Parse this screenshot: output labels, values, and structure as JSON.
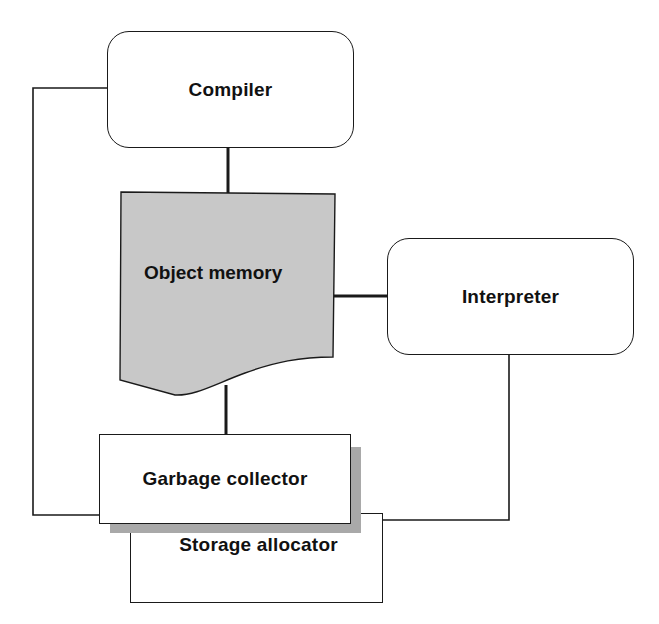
{
  "diagram": {
    "nodes": {
      "compiler": {
        "label": "Compiler",
        "shape": "rounded-rectangle"
      },
      "object_memory": {
        "label": "Object memory",
        "shape": "document",
        "fill": "#c8c8c8"
      },
      "interpreter": {
        "label": "Interpreter",
        "shape": "rounded-rectangle"
      },
      "garbage_collector": {
        "label": "Garbage collector",
        "shape": "rectangle-with-shadow"
      },
      "storage_allocator": {
        "label": "Storage allocator",
        "shape": "rectangle"
      }
    },
    "edges": [
      {
        "from": "compiler",
        "to": "object_memory",
        "style": "thick"
      },
      {
        "from": "object_memory",
        "to": "interpreter",
        "style": "thick"
      },
      {
        "from": "object_memory",
        "to": "garbage_collector",
        "style": "thick"
      },
      {
        "from": "compiler",
        "to": "garbage_collector",
        "style": "thin"
      },
      {
        "from": "interpreter",
        "to": "storage_allocator",
        "style": "thin"
      }
    ],
    "colors": {
      "stroke": "#1a1a1a",
      "object_memory_fill": "#c8c8c8",
      "shadow": "#a9a9a9",
      "background": "#ffffff"
    }
  }
}
